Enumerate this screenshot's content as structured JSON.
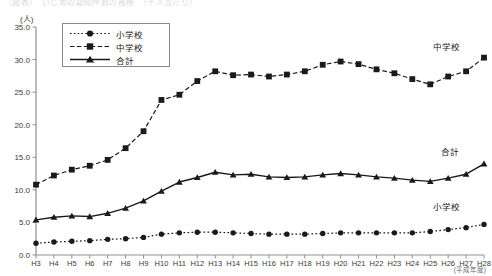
{
  "page": {
    "cut_title": "（図表）　いじめの認知件数の推移　（千人当たり）",
    "axis_note": "(平成年度)"
  },
  "axes": {
    "y_unit": "(人)",
    "y_ticks": [
      "0.0",
      "5.0",
      "10.0",
      "15.0",
      "20.0",
      "25.0",
      "30.0",
      "35.0"
    ],
    "y_min": 0.0,
    "y_max": 35.0,
    "y_step": 5.0,
    "x_ticks": [
      "H3",
      "H4",
      "H5",
      "H6",
      "H7",
      "H8",
      "H9",
      "H10",
      "H11",
      "H12",
      "H13",
      "H14",
      "H15",
      "H16",
      "H17",
      "H18",
      "H19",
      "H20",
      "H21",
      "H22",
      "H23",
      "H24",
      "H25",
      "H26",
      "H27",
      "H28"
    ]
  },
  "legend": {
    "items": [
      {
        "label": "小学校",
        "marker": "circle",
        "dash": "dotted"
      },
      {
        "label": "中学校",
        "marker": "square",
        "dash": "dashed"
      },
      {
        "label": "合計",
        "marker": "triangle",
        "dash": "solid"
      }
    ]
  },
  "inline_labels": [
    {
      "name": "chugakko",
      "text": "中学校",
      "x": 446,
      "y": 46
    },
    {
      "name": "goukei",
      "text": "合計",
      "x": 450,
      "y": 151
    },
    {
      "name": "shogakko",
      "text": "小学校",
      "x": 446,
      "y": 206
    }
  ],
  "colors": {
    "line": "#1a1a1a",
    "axis": "#808080",
    "text": "#1a1a1a",
    "background": "#ffffff"
  },
  "chart_data": {
    "type": "line",
    "title": "",
    "xlabel": "(平成年度)",
    "ylabel": "(人)",
    "ylim": [
      0.0,
      35.0
    ],
    "grid": false,
    "legend_position": "upper-left-inset",
    "categories": [
      "H3",
      "H4",
      "H5",
      "H6",
      "H7",
      "H8",
      "H9",
      "H10",
      "H11",
      "H12",
      "H13",
      "H14",
      "H15",
      "H16",
      "H17",
      "H18",
      "H19",
      "H20",
      "H21",
      "H22",
      "H23",
      "H24",
      "H25",
      "H26",
      "H27",
      "H28"
    ],
    "series": [
      {
        "name": "小学校",
        "marker": "circle",
        "dash": "dotted",
        "values": [
          1.8,
          2.0,
          2.1,
          2.2,
          2.4,
          2.5,
          2.7,
          3.2,
          3.4,
          3.5,
          3.5,
          3.4,
          3.3,
          3.2,
          3.2,
          3.2,
          3.3,
          3.4,
          3.4,
          3.4,
          3.4,
          3.4,
          3.6,
          3.9,
          4.2,
          4.7
        ]
      },
      {
        "name": "中学校",
        "marker": "square",
        "dash": "dashed",
        "values": [
          10.8,
          12.2,
          13.1,
          13.7,
          14.6,
          16.4,
          19.0,
          23.8,
          24.6,
          26.7,
          28.2,
          27.6,
          27.7,
          27.4,
          27.7,
          28.2,
          29.2,
          29.7,
          29.3,
          28.5,
          27.9,
          27.0,
          26.2,
          27.4,
          28.2,
          30.3
        ]
      },
      {
        "name": "合計",
        "marker": "triangle",
        "dash": "solid",
        "values": [
          5.4,
          5.8,
          6.0,
          5.9,
          6.4,
          7.2,
          8.3,
          9.8,
          11.2,
          11.9,
          12.7,
          12.3,
          12.4,
          12.0,
          11.9,
          12.0,
          12.3,
          12.5,
          12.3,
          12.0,
          11.8,
          11.5,
          11.3,
          11.8,
          12.4,
          14.0
        ]
      }
    ]
  }
}
